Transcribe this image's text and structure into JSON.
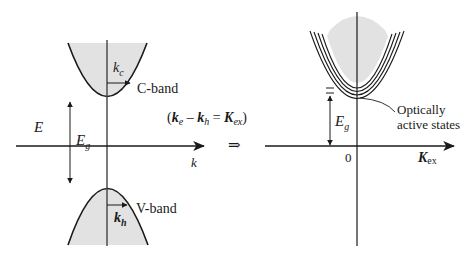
{
  "left_panel": {
    "energy_axis_label": "E",
    "k_axis_label": "k",
    "gap_label": "E",
    "gap_sub": "g",
    "conduction_band_label": "C-band",
    "valence_band_label": "V-band",
    "kc_label": "k",
    "kc_sub": "c",
    "kh_label": "k",
    "kh_sub": "h"
  },
  "middle": {
    "equation": {
      "open": "(",
      "ke": "k",
      "ke_sub": "e",
      "minus": " – ",
      "kh": "k",
      "kh_sub": "h",
      "equals": " = ",
      "K": "K",
      "K_sub": "ex",
      "close": ")"
    },
    "implies_symbol": "⇒"
  },
  "right_panel": {
    "origin_label": "0",
    "x_axis_label": "K",
    "x_axis_sub": "ex",
    "gap_label": "E",
    "gap_sub": "g",
    "annotation_line1": "Optically",
    "annotation_line2": "active states"
  },
  "colors": {
    "band_fill": "#e2e2e2",
    "line": "#1a1a1a"
  }
}
